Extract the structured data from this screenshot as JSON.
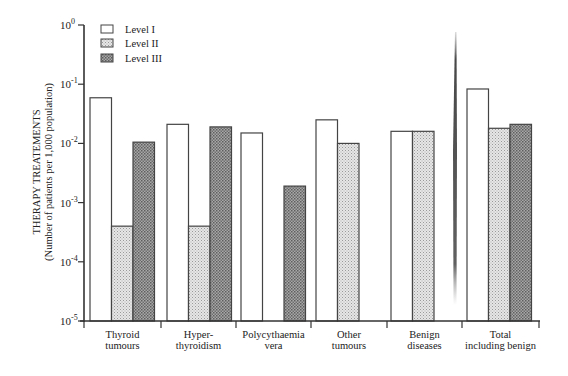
{
  "chart_data": {
    "type": "bar",
    "title": "",
    "ylabel": "THERAPY TREATEMENTS",
    "ylabel_sub": "(Number of patients per 1,000 population)",
    "xlabel": "",
    "yscale": "log",
    "ylim": [
      1e-05,
      1
    ],
    "yticks": [
      {
        "value": 1,
        "base": "10",
        "exp": "0"
      },
      {
        "value": 0.1,
        "base": "10",
        "exp": "-1"
      },
      {
        "value": 0.01,
        "base": "10",
        "exp": "-2"
      },
      {
        "value": 0.001,
        "base": "10",
        "exp": "-3"
      },
      {
        "value": 0.0001,
        "base": "10",
        "exp": "-4"
      },
      {
        "value": 1e-05,
        "base": "10",
        "exp": "-5"
      }
    ],
    "categories": [
      [
        "Thyroid",
        "tumours"
      ],
      [
        "Hyper-",
        "thyroidism"
      ],
      [
        "Polycythaemia",
        "vera"
      ],
      [
        "Other",
        "tumours"
      ],
      [
        "Benign",
        "diseases"
      ],
      [
        "Total",
        "including benign"
      ]
    ],
    "series": [
      {
        "name": "Level I",
        "pattern": "white",
        "values": [
          0.059,
          0.021,
          0.015,
          0.025,
          0.016,
          0.083
        ]
      },
      {
        "name": "Level II",
        "pattern": "light-dotted",
        "values": [
          0.0004,
          0.0004,
          null,
          0.01,
          0.016,
          0.018
        ]
      },
      {
        "name": "Level III",
        "pattern": "dark-crosshatch",
        "values": [
          0.0105,
          0.019,
          0.0019,
          null,
          null,
          0.021
        ]
      }
    ],
    "legend_position": "upper-left",
    "grid": false,
    "annotations": [
      "dark vertical scan artifact stroke between Benign diseases and Total groups"
    ]
  },
  "legend": {
    "items": [
      {
        "label": "Level I"
      },
      {
        "label": "Level II"
      },
      {
        "label": "Level III"
      }
    ]
  },
  "colors": {
    "axis": "#333333",
    "level1_fill": "#ffffff",
    "level2_fill": "#d8d8d8",
    "level3_fill": "#9a9a9a",
    "bar_stroke": "#444444"
  }
}
